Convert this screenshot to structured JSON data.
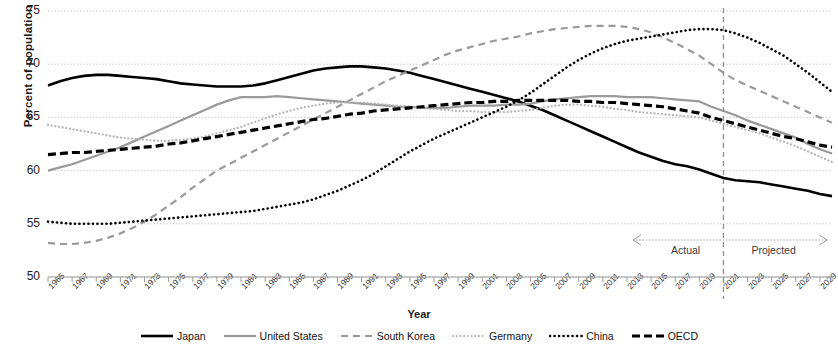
{
  "chart_data": {
    "type": "line",
    "title": "",
    "xlabel": "Year",
    "ylabel": "Percent of population",
    "ylim": [
      50,
      75
    ],
    "yticks": [
      50,
      55,
      60,
      65,
      70,
      75
    ],
    "xlim": [
      1965,
      2030
    ],
    "xticks": [
      1965,
      1967,
      1969,
      1971,
      1973,
      1975,
      1977,
      1979,
      1981,
      1983,
      1985,
      1987,
      1989,
      1991,
      1993,
      1995,
      1997,
      1999,
      2001,
      2003,
      2005,
      2007,
      2009,
      2011,
      2013,
      2015,
      2017,
      2019,
      2021,
      2023,
      2025,
      2027,
      2029
    ],
    "grid": "horizontal-dotted",
    "legend_position": "bottom",
    "x": [
      1965,
      1966,
      1967,
      1968,
      1969,
      1970,
      1971,
      1972,
      1973,
      1974,
      1975,
      1976,
      1977,
      1978,
      1979,
      1980,
      1981,
      1982,
      1983,
      1984,
      1985,
      1986,
      1987,
      1988,
      1989,
      1990,
      1991,
      1992,
      1993,
      1994,
      1995,
      1996,
      1997,
      1998,
      1999,
      2000,
      2001,
      2002,
      2003,
      2004,
      2005,
      2006,
      2007,
      2008,
      2009,
      2010,
      2011,
      2012,
      2013,
      2014,
      2015,
      2016,
      2017,
      2018,
      2019,
      2020,
      2021,
      2022,
      2023,
      2024,
      2025,
      2026,
      2027,
      2028,
      2029,
      2030
    ],
    "series": [
      {
        "name": "Japan",
        "style": "solid",
        "color": "#000000",
        "width": 2.6,
        "values": [
          68.0,
          68.4,
          68.7,
          68.9,
          69.0,
          69.0,
          68.9,
          68.8,
          68.7,
          68.6,
          68.4,
          68.2,
          68.1,
          68.0,
          67.9,
          67.9,
          67.9,
          68.0,
          68.2,
          68.5,
          68.8,
          69.1,
          69.4,
          69.6,
          69.7,
          69.8,
          69.8,
          69.7,
          69.6,
          69.4,
          69.2,
          68.9,
          68.6,
          68.3,
          68.0,
          67.7,
          67.4,
          67.1,
          66.8,
          66.5,
          66.1,
          65.7,
          65.2,
          64.7,
          64.2,
          63.7,
          63.2,
          62.7,
          62.2,
          61.7,
          61.3,
          60.9,
          60.6,
          60.4,
          60.1,
          59.7,
          59.3,
          59.1,
          59.0,
          58.9,
          58.7,
          58.5,
          58.3,
          58.1,
          57.8,
          57.6
        ]
      },
      {
        "name": "United States",
        "style": "solid",
        "color": "#9a9a9a",
        "width": 2.2,
        "values": [
          60.0,
          60.3,
          60.6,
          61.0,
          61.4,
          61.8,
          62.2,
          62.7,
          63.2,
          63.7,
          64.2,
          64.7,
          65.2,
          65.7,
          66.2,
          66.6,
          66.9,
          66.9,
          66.9,
          67.0,
          66.9,
          66.8,
          66.7,
          66.6,
          66.5,
          66.4,
          66.3,
          66.2,
          66.1,
          66.0,
          66.0,
          65.9,
          65.9,
          65.9,
          66.0,
          66.1,
          66.1,
          66.1,
          66.2,
          66.2,
          66.3,
          66.5,
          66.7,
          66.8,
          66.9,
          67.0,
          67.0,
          67.0,
          66.9,
          66.9,
          66.9,
          66.8,
          66.7,
          66.6,
          66.5,
          66.0,
          65.6,
          65.2,
          64.7,
          64.3,
          63.9,
          63.5,
          63.1,
          62.5,
          62.0,
          61.6
        ]
      },
      {
        "name": "South Korea",
        "style": "dashed",
        "color": "#9a9a9a",
        "width": 2.2,
        "values": [
          53.2,
          53.1,
          53.1,
          53.2,
          53.4,
          53.7,
          54.1,
          54.6,
          55.2,
          55.9,
          56.7,
          57.5,
          58.4,
          59.2,
          60.0,
          60.6,
          61.2,
          61.8,
          62.4,
          63.0,
          63.6,
          64.2,
          64.8,
          65.4,
          66.0,
          66.6,
          67.2,
          67.8,
          68.4,
          68.9,
          69.4,
          69.9,
          70.4,
          70.9,
          71.3,
          71.6,
          71.9,
          72.2,
          72.4,
          72.6,
          72.9,
          73.1,
          73.3,
          73.4,
          73.5,
          73.6,
          73.6,
          73.6,
          73.5,
          73.3,
          73.0,
          72.5,
          72.0,
          71.4,
          70.8,
          70.0,
          69.2,
          68.5,
          68.0,
          67.5,
          67.0,
          66.5,
          66.0,
          65.5,
          65.0,
          64.5
        ]
      },
      {
        "name": "Germany",
        "style": "dotted",
        "color": "#b5b5b5",
        "width": 2.2,
        "values": [
          64.3,
          64.1,
          63.9,
          63.7,
          63.5,
          63.3,
          63.1,
          63.0,
          62.9,
          62.8,
          62.8,
          62.9,
          63.0,
          63.2,
          63.5,
          63.8,
          64.1,
          64.5,
          64.9,
          65.3,
          65.6,
          65.9,
          66.1,
          66.3,
          66.4,
          66.4,
          66.4,
          66.3,
          66.2,
          66.1,
          66.0,
          65.9,
          65.8,
          65.7,
          65.6,
          65.6,
          65.5,
          65.5,
          65.5,
          65.6,
          65.7,
          65.9,
          66.1,
          66.2,
          66.2,
          66.1,
          66.0,
          65.8,
          65.7,
          65.5,
          65.4,
          65.3,
          65.2,
          65.1,
          65.0,
          64.7,
          64.4,
          64.1,
          63.8,
          63.5,
          63.1,
          62.7,
          62.3,
          61.8,
          61.3,
          60.8
        ]
      },
      {
        "name": "China",
        "style": "dotted",
        "color": "#000000",
        "width": 2.6,
        "values": [
          55.2,
          55.1,
          55.0,
          55.0,
          55.0,
          55.0,
          55.1,
          55.2,
          55.3,
          55.4,
          55.5,
          55.6,
          55.7,
          55.8,
          55.9,
          56.0,
          56.1,
          56.2,
          56.4,
          56.6,
          56.8,
          57.0,
          57.3,
          57.7,
          58.1,
          58.6,
          59.1,
          59.7,
          60.4,
          61.1,
          61.8,
          62.4,
          63.0,
          63.5,
          64.0,
          64.5,
          65.0,
          65.5,
          66.0,
          66.6,
          67.3,
          68.1,
          68.9,
          69.7,
          70.4,
          71.0,
          71.5,
          71.9,
          72.2,
          72.4,
          72.6,
          72.8,
          73.0,
          73.2,
          73.3,
          73.3,
          73.2,
          72.9,
          72.5,
          72.0,
          71.4,
          70.8,
          70.0,
          69.2,
          68.3,
          67.4
        ]
      },
      {
        "name": "OECD",
        "style": "dashed",
        "color": "#000000",
        "width": 3.2,
        "values": [
          61.5,
          61.6,
          61.7,
          61.7,
          61.8,
          61.9,
          62.0,
          62.1,
          62.2,
          62.3,
          62.5,
          62.6,
          62.8,
          63.0,
          63.2,
          63.4,
          63.6,
          63.8,
          64.0,
          64.2,
          64.4,
          64.6,
          64.8,
          64.9,
          65.1,
          65.3,
          65.4,
          65.6,
          65.7,
          65.8,
          65.9,
          66.0,
          66.1,
          66.2,
          66.3,
          66.4,
          66.4,
          66.5,
          66.5,
          66.6,
          66.6,
          66.6,
          66.6,
          66.6,
          66.5,
          66.5,
          66.4,
          66.4,
          66.3,
          66.2,
          66.1,
          66.0,
          65.8,
          65.6,
          65.4,
          65.0,
          64.7,
          64.4,
          64.1,
          63.8,
          63.5,
          63.2,
          63.0,
          62.7,
          62.4,
          62.2
        ]
      }
    ],
    "annotations": {
      "divider_year": 2021,
      "left_label": "Actual",
      "right_label": "Projected"
    }
  },
  "legend": {
    "items": [
      {
        "label": "Japan"
      },
      {
        "label": "United States"
      },
      {
        "label": "South Korea"
      },
      {
        "label": "Germany"
      },
      {
        "label": "China"
      },
      {
        "label": "OECD"
      }
    ]
  }
}
